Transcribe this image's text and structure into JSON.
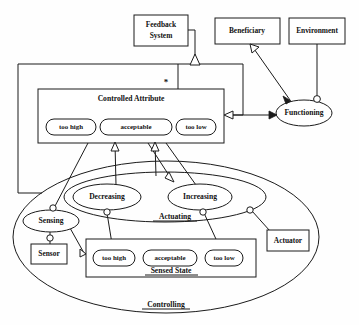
{
  "diagram": {
    "type": "uml-collaboration-diagram",
    "colors": {
      "stroke": "#1b1b1b",
      "fill": "#ffffff",
      "background": "#fefefe",
      "text": "#111111"
    },
    "boxes": [
      {
        "id": "feedback-system",
        "label": "Feedback\nSystem",
        "line1": "Feedback",
        "line2": "System",
        "x": 134,
        "y": 15,
        "w": 54,
        "h": 31
      },
      {
        "id": "beneficiary",
        "label": "Beneficiary",
        "x": 215,
        "y": 18,
        "w": 65,
        "h": 26
      },
      {
        "id": "environment",
        "label": "Environment",
        "x": 289,
        "y": 18,
        "w": 56,
        "h": 26
      },
      {
        "id": "sensor",
        "label": "Sensor",
        "x": 31,
        "y": 244,
        "w": 36,
        "h": 20
      },
      {
        "id": "actuator",
        "label": "Actuator",
        "x": 267,
        "y": 230,
        "w": 42,
        "h": 21
      }
    ],
    "container_boxes": [
      {
        "id": "controlled-attribute",
        "label": "Controlled Attribute",
        "x": 38,
        "y": 89,
        "w": 186,
        "h": 54,
        "label_pos": "top"
      },
      {
        "id": "sensed-state",
        "label": "Sensed State",
        "x": 86,
        "y": 239,
        "w": 170,
        "h": 38,
        "label_pos": "bottom"
      }
    ],
    "ellipses": [
      {
        "id": "functioning",
        "label": "Functioning",
        "cx": 304,
        "cy": 113,
        "rx": 28,
        "ry": 13
      },
      {
        "id": "sensing",
        "label": "Sensing",
        "cx": 51,
        "cy": 221,
        "rx": 28,
        "ry": 11
      },
      {
        "id": "decreasing",
        "label": "Decreasing",
        "cx": 107,
        "cy": 197,
        "rx": 34,
        "ry": 13
      },
      {
        "id": "increasing",
        "label": "Increasing",
        "cx": 200,
        "cy": 197,
        "rx": 32,
        "ry": 13
      },
      {
        "id": "actuating",
        "label": "Actuating",
        "cx": 165,
        "cy": 197,
        "rx": 101,
        "ry": 25,
        "label_pos": "bottom",
        "label_x": 175,
        "label_y": 217
      },
      {
        "id": "controlling",
        "label": "Controlling",
        "cx": 166,
        "cy": 237,
        "rx": 153,
        "ry": 76,
        "label_pos": "bottom",
        "label_x": 166,
        "label_y": 305
      }
    ],
    "pills": {
      "controlled_attribute_states": [
        {
          "id": "ca-too-high",
          "label": "too high",
          "x": 46,
          "y": 119,
          "w": 50,
          "h": 16
        },
        {
          "id": "ca-acceptable",
          "label": "acceptable",
          "x": 100,
          "y": 119,
          "w": 72,
          "h": 16
        },
        {
          "id": "ca-too-low",
          "label": "too low",
          "x": 176,
          "y": 119,
          "w": 40,
          "h": 16
        }
      ],
      "sensed_state_states": [
        {
          "id": "ss-too-high",
          "label": "too high",
          "x": 93,
          "y": 250,
          "w": 42,
          "h": 16
        },
        {
          "id": "ss-acceptable",
          "label": "acceptable",
          "x": 143,
          "y": 250,
          "w": 54,
          "h": 16
        },
        {
          "id": "ss-too-low",
          "label": "too low",
          "x": 205,
          "y": 250,
          "w": 38,
          "h": 16
        }
      ]
    },
    "multiplicity_markers": [
      {
        "id": "star-multiplicity",
        "label": "*",
        "x": 166,
        "y": 83
      }
    ],
    "connectors": [
      {
        "id": "feedback-aggregation",
        "from": "feedback-system",
        "to": "controlled-attribute",
        "arrow": "hollow-triangle"
      },
      {
        "id": "beneficiary-functioning",
        "from": "beneficiary",
        "to": "functioning",
        "arrow": "double"
      },
      {
        "id": "environment-functioning",
        "from": "environment",
        "to": "functioning",
        "arrow": "ball-socket"
      },
      {
        "id": "functioning-controlled-attribute",
        "from": "functioning",
        "to": "controlled-attribute",
        "arrow": "hollow-triangle"
      },
      {
        "id": "decreasing-acceptable",
        "from": "decreasing",
        "to": "ca-acceptable",
        "arrow": "hollow-triangle"
      },
      {
        "id": "increasing-acceptable",
        "from": "increasing",
        "to": "ca-acceptable",
        "arrow": "hollow-triangle"
      },
      {
        "id": "sensing-sensor",
        "from": "sensing",
        "to": "sensor",
        "arrow": "ball-socket"
      },
      {
        "id": "sensing-sensed-state",
        "from": "sensing",
        "to": "sensed-state",
        "arrow": "ball-socket"
      },
      {
        "id": "decreasing-too-high",
        "from": "decreasing",
        "to": "ss-too-high",
        "arrow": "ball-socket"
      },
      {
        "id": "increasing-too-low",
        "from": "increasing",
        "to": "ss-too-low",
        "arrow": "ball-socket"
      },
      {
        "id": "actuating-actuator",
        "from": "actuating",
        "to": "actuator",
        "arrow": "ball-socket"
      },
      {
        "id": "controlling-controlled-attribute",
        "from": "controlling",
        "to": "ca-acceptable",
        "arrow": "hollow-triangle"
      }
    ]
  }
}
